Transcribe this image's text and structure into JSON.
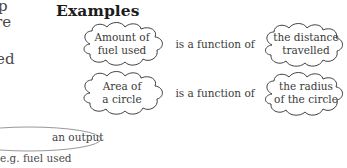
{
  "page": {
    "background_color": "#ffffff",
    "ink_color": "#3a3a3a",
    "title": "Examples"
  },
  "margin_fragments": [
    {
      "text": "p"
    },
    {
      "text": "re"
    },
    {
      "text": "ed"
    }
  ],
  "examples": {
    "connector_label": "is a function of",
    "rows": [
      {
        "output_line1": "Amount of",
        "output_line2": "fuel used",
        "connector": "is a function of",
        "input_line1": "the distance",
        "input_line2": "travelled"
      },
      {
        "output_line1": "Area of",
        "output_line2": "a circle",
        "connector": "is a function of",
        "input_line1": "the radius",
        "input_line2": "of the circle"
      }
    ]
  },
  "legend": {
    "ellipse_label": "an output",
    "footnote": "e.g. fuel used"
  }
}
